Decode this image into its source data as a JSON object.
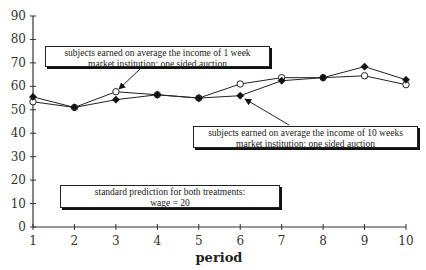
{
  "chart_data": {
    "type": "line",
    "title": "",
    "xlabel": "period",
    "ylabel": "",
    "x": [
      1,
      2,
      3,
      4,
      5,
      6,
      7,
      8,
      9,
      10
    ],
    "xticks": [
      "1",
      "2",
      "3",
      "4",
      "5",
      "6",
      "7",
      "8",
      "9",
      "10"
    ],
    "yticks": [
      "0",
      "10",
      "20",
      "30",
      "40",
      "50",
      "60",
      "70",
      "80",
      "90"
    ],
    "ylim": [
      0,
      90
    ],
    "xlim": [
      1,
      10
    ],
    "grid": false,
    "legend": "none (annotated with callout boxes)",
    "series": [
      {
        "name": "subjects earned on average the income of 1 week",
        "marker": "open-circle",
        "values": [
          53.4,
          51,
          57.7,
          56.4,
          55,
          61,
          63.7,
          63.7,
          64.5,
          60.7
        ]
      },
      {
        "name": "subjects earned on average the income of 10 weeks",
        "marker": "filled-diamond",
        "values": [
          55.5,
          51,
          54.3,
          56.4,
          55,
          56,
          62.4,
          63.7,
          68.4,
          62.8
        ]
      }
    ],
    "annotations": [
      {
        "id": "one-week",
        "lines": [
          "subjects earned on average the income of 1 week",
          "market institution: one sided auction"
        ],
        "points_to": {
          "series": "1 week",
          "period": 3
        }
      },
      {
        "id": "ten-weeks",
        "lines": [
          "subjects earned on average the income of 10 weeks",
          "market institution: one sided auction"
        ],
        "points_to": {
          "series": "10 weeks",
          "period": 6
        }
      },
      {
        "id": "prediction",
        "lines": [
          "standard prediction for both treatments:",
          "wage = 20"
        ]
      }
    ]
  },
  "notes": {
    "one_week": {
      "line1": "subjects earned on average the income of 1 week",
      "line2": "market institution: one sided auction"
    },
    "ten_weeks": {
      "line1": "subjects earned on average the income of 10 weeks",
      "line2": "market institution: one sided auction"
    },
    "prediction": {
      "line1": "standard prediction for both treatments:",
      "line2": "wage = 20"
    }
  },
  "axis": {
    "x_title": "period"
  }
}
